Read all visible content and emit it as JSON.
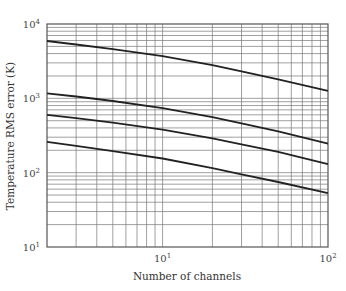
{
  "chart_data": {
    "type": "line",
    "title": "",
    "xlabel": "Number of channels",
    "ylabel": "Temperature RMS error (K)",
    "xscale": "log",
    "yscale": "log",
    "xlim": [
      2,
      100
    ],
    "ylim": [
      10,
      10000
    ],
    "grid": true,
    "legend": null,
    "x_ticks": [
      {
        "base": "10",
        "exp": "1",
        "value": 10
      },
      {
        "base": "10",
        "exp": "2",
        "value": 100
      }
    ],
    "y_ticks": [
      {
        "base": "10",
        "exp": "1",
        "value": 10
      },
      {
        "base": "10",
        "exp": "2",
        "value": 100
      },
      {
        "base": "10",
        "exp": "3",
        "value": 1000
      },
      {
        "base": "10",
        "exp": "4",
        "value": 10000
      }
    ],
    "x": [
      2,
      3,
      5,
      10,
      20,
      30,
      50,
      100
    ],
    "series": [
      {
        "name": "curve-1",
        "values": [
          5900,
          5300,
          4600,
          3700,
          2800,
          2300,
          1800,
          1260
        ]
      },
      {
        "name": "curve-2",
        "values": [
          1170,
          1060,
          920,
          740,
          560,
          460,
          360,
          245
        ]
      },
      {
        "name": "curve-3",
        "values": [
          600,
          540,
          470,
          380,
          290,
          240,
          190,
          130
        ]
      },
      {
        "name": "curve-4",
        "values": [
          260,
          230,
          195,
          155,
          115,
          95,
          75,
          53
        ]
      }
    ]
  }
}
